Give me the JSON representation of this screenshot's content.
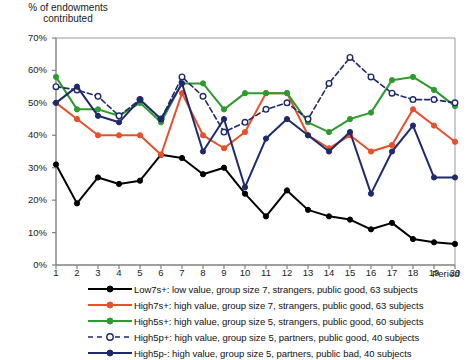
{
  "chart_data": {
    "type": "line",
    "title": "% of endowments contributed",
    "xlabel": "Period",
    "ylabel": "% of endowments contributed",
    "x": [
      1,
      2,
      3,
      4,
      5,
      6,
      7,
      8,
      9,
      10,
      11,
      12,
      13,
      14,
      15,
      16,
      17,
      18,
      19,
      20
    ],
    "xlim": [
      1,
      20
    ],
    "ylim": [
      0,
      70
    ],
    "ytick_labels": [
      "0%",
      "10%",
      "20%",
      "30%",
      "40%",
      "50%",
      "60%",
      "70%"
    ],
    "ytick_values": [
      0,
      10,
      20,
      30,
      40,
      50,
      60,
      70
    ],
    "grid": false,
    "legend_position": "below",
    "series": [
      {
        "name": "Low7s+",
        "label": "Low7s+: low value, group size 7, strangers, public good, 63 subjects",
        "color": "#000000",
        "dash": false,
        "marker": "filled-circle",
        "values": [
          31,
          19,
          27,
          25,
          26,
          34,
          33,
          28,
          30,
          22,
          15,
          23,
          17,
          15,
          14,
          11,
          13,
          8,
          7,
          6.5
        ]
      },
      {
        "name": "High7s+",
        "label": "High7s+: high value, group size 7, strangers, public good, 63 subjects",
        "color": "#E8502A",
        "dash": false,
        "marker": "filled-circle",
        "values": [
          50,
          45,
          40,
          40,
          40,
          34,
          53,
          40,
          36,
          41,
          53,
          53,
          40,
          36,
          40,
          35,
          37,
          48,
          43,
          38
        ]
      },
      {
        "name": "High5s+",
        "label": "High5s+: high value, group size 5, strangers, public good, 60 subjects",
        "color": "#2E9B2E",
        "dash": false,
        "marker": "filled-circle",
        "values": [
          58,
          48,
          48,
          46,
          50,
          44,
          56,
          56,
          48,
          53,
          53,
          53,
          44,
          41,
          45,
          47,
          57,
          58,
          54,
          49
        ]
      },
      {
        "name": "High5p+",
        "label": "High5p+: high value, group size 5, partners, public good, 40 subjects",
        "color": "#1F2A6B",
        "dash": true,
        "marker": "open-circle",
        "values": [
          55,
          54,
          52,
          46,
          51,
          45,
          58,
          52,
          41,
          44,
          48,
          50,
          45,
          56,
          64,
          58,
          53,
          51,
          51,
          50
        ]
      },
      {
        "name": "High5p-",
        "label": "High5p-: high value, group size 5, partners,  public bad, 40 subjects",
        "color": "#1F2A6B",
        "dash": false,
        "marker": "filled-circle",
        "values": [
          50,
          55,
          46,
          44,
          51,
          45,
          56,
          35,
          45,
          24,
          39,
          45,
          40,
          35,
          41,
          22,
          35,
          43,
          27,
          27
        ]
      }
    ]
  }
}
